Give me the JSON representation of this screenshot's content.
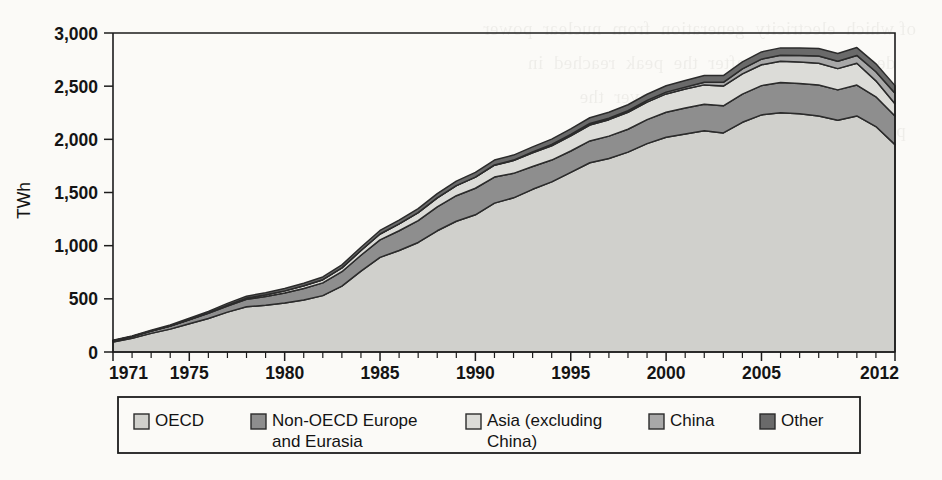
{
  "figure": {
    "background_color": "#fbfaf7",
    "ink_color": "#1c1c1c"
  },
  "ghost_text": "of which  electricity  generation  from  nuclear  power\n    declined  steadily  after  the  peak  reached  in\n        several  member  countries  over  the\n  period  considered  here,  while  the  share\n      of  renewables  increased  from  1.2%  to\n    3.7%  of  the  total  supply  in  the  region",
  "chart_data": {
    "type": "area",
    "stacked": true,
    "title": "",
    "subtitle": "",
    "xlabel": "",
    "ylabel": "TWh",
    "xlim": [
      1971,
      2012
    ],
    "ylim": [
      0,
      3000
    ],
    "grid": false,
    "legend_position": "bottom",
    "y_ticks": [
      0,
      500,
      1000,
      1500,
      2000,
      2500,
      3000
    ],
    "y_ticklabels": [
      "0",
      "500",
      "1,000",
      "1,500",
      "2,000",
      "2,500",
      "3,000"
    ],
    "x_ticklabels": [
      "1971",
      "1975",
      "1980",
      "1985",
      "1990",
      "1995",
      "2000",
      "2005",
      "2012"
    ],
    "x_ticklabel_years": [
      1971,
      1975,
      1980,
      1985,
      1990,
      1995,
      2000,
      2005,
      2012
    ],
    "x_minor_tick_interval": 1,
    "x": [
      1971,
      1972,
      1973,
      1974,
      1975,
      1976,
      1977,
      1978,
      1979,
      1980,
      1981,
      1982,
      1983,
      1984,
      1985,
      1986,
      1987,
      1988,
      1989,
      1990,
      1991,
      1992,
      1993,
      1994,
      1995,
      1996,
      1997,
      1998,
      1999,
      2000,
      2001,
      2002,
      2003,
      2004,
      2005,
      2006,
      2007,
      2008,
      2009,
      2010,
      2011,
      2012
    ],
    "series": [
      {
        "name": "OECD",
        "color": "#d0d0cc",
        "values": [
          95,
          130,
          175,
          215,
          265,
          315,
          375,
          425,
          440,
          460,
          490,
          530,
          620,
          760,
          890,
          955,
          1030,
          1140,
          1230,
          1290,
          1400,
          1450,
          1530,
          1600,
          1690,
          1780,
          1820,
          1880,
          1960,
          2020,
          2050,
          2080,
          2060,
          2160,
          2230,
          2250,
          2240,
          2220,
          2180,
          2220,
          2120,
          1950
        ]
      },
      {
        "name": "Non-OECD Europe and Eurasia",
        "color": "#8e8e8e",
        "values": [
          10,
          15,
          22,
          30,
          38,
          48,
          58,
          70,
          82,
          95,
          108,
          120,
          135,
          150,
          165,
          185,
          205,
          225,
          240,
          250,
          245,
          230,
          215,
          205,
          200,
          205,
          210,
          215,
          225,
          235,
          245,
          250,
          255,
          265,
          275,
          285,
          285,
          290,
          285,
          290,
          280,
          270
        ]
      },
      {
        "name": "Asia (excluding China)",
        "color": "#dcdcd8",
        "values": [
          0,
          0,
          0,
          0,
          2,
          5,
          8,
          12,
          16,
          20,
          25,
          30,
          36,
          45,
          55,
          65,
          75,
          85,
          95,
          105,
          112,
          120,
          128,
          135,
          142,
          150,
          155,
          160,
          165,
          172,
          178,
          182,
          186,
          190,
          196,
          200,
          202,
          205,
          200,
          205,
          150,
          115
        ]
      },
      {
        "name": "China",
        "color": "#a8a8a8",
        "values": [
          0,
          0,
          0,
          0,
          0,
          0,
          0,
          0,
          0,
          0,
          0,
          0,
          0,
          0,
          0,
          0,
          0,
          0,
          0,
          0,
          2,
          5,
          8,
          12,
          14,
          14,
          14,
          14,
          16,
          17,
          18,
          25,
          35,
          48,
          53,
          55,
          62,
          68,
          70,
          74,
          86,
          98
        ]
      },
      {
        "name": "Other",
        "color": "#6a6a6a",
        "values": [
          5,
          6,
          8,
          10,
          12,
          14,
          16,
          18,
          20,
          22,
          24,
          26,
          28,
          30,
          33,
          36,
          38,
          40,
          42,
          44,
          46,
          47,
          48,
          50,
          52,
          54,
          55,
          56,
          58,
          60,
          62,
          63,
          64,
          66,
          68,
          70,
          70,
          72,
          72,
          74,
          74,
          72
        ]
      }
    ],
    "annotations": []
  },
  "legend": {
    "items": [
      {
        "label": "OECD",
        "color": "#d0d0cc"
      },
      {
        "label": "Non-OECD Europe and Eurasia",
        "color": "#8e8e8e"
      },
      {
        "label": "Asia (excluding China)",
        "color": "#dcdcd8"
      },
      {
        "label": "China",
        "color": "#a8a8a8"
      },
      {
        "label": "Other",
        "color": "#6a6a6a"
      }
    ]
  }
}
